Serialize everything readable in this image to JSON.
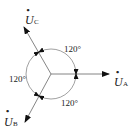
{
  "diagram": {
    "title": "",
    "type": "three-phase phasor diagram",
    "colors": {
      "line": "#666666",
      "arrow": "#111111",
      "text": "#222222",
      "background": "#ffffff"
    },
    "center": {
      "x": 51,
      "y": 74
    },
    "circle_radius": 25,
    "phasors": [
      {
        "id": "A",
        "letter": "U",
        "subscript": "A",
        "dot": "•",
        "angle_deg": 0,
        "tip": {
          "x": 109,
          "y": 74
        }
      },
      {
        "id": "C",
        "letter": "U",
        "subscript": "C",
        "dot": "•",
        "angle_deg": 120,
        "tip": {
          "x": 24,
          "y": 27
        }
      },
      {
        "id": "B",
        "letter": "U",
        "subscript": "B",
        "dot": "•",
        "angle_deg": 240,
        "tip": {
          "x": 25,
          "y": 122
        }
      }
    ],
    "angle_labels": [
      {
        "text": "120°",
        "position": "top-right"
      },
      {
        "text": "120°",
        "position": "left"
      },
      {
        "text": "120°",
        "position": "bottom-right"
      }
    ]
  }
}
